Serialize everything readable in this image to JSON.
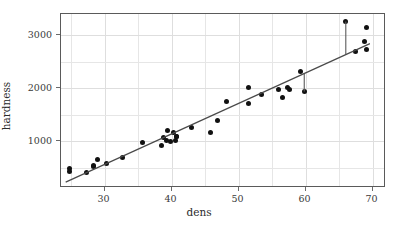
{
  "chart_data": {
    "type": "scatter",
    "title": "",
    "xlabel": "dens",
    "ylabel": "hardness",
    "xlim": [
      23.5,
      72.0
    ],
    "ylim": [
      120,
      3400
    ],
    "grid": true,
    "legend": null,
    "xticks": [
      30,
      40,
      50,
      60,
      70
    ],
    "xtick_labels": [
      "30",
      "40",
      "50",
      "60",
      "70"
    ],
    "yticks": [
      1000,
      2000,
      3000
    ],
    "ytick_labels": [
      "1000",
      "2000",
      "3000"
    ],
    "minor_xticks": [
      25,
      35,
      45,
      55,
      65
    ],
    "minor_yticks": [
      500,
      1500,
      2500
    ],
    "point_color": "#111111",
    "line_color": "#4a4a4a",
    "grid_color": "#e6e6e6",
    "frame_color": "#5a5a5a",
    "points": [
      {
        "x": 24.7,
        "y": 484
      },
      {
        "x": 24.8,
        "y": 427
      },
      {
        "x": 27.3,
        "y": 413
      },
      {
        "x": 28.4,
        "y": 517
      },
      {
        "x": 28.4,
        "y": 549
      },
      {
        "x": 29.0,
        "y": 648
      },
      {
        "x": 30.3,
        "y": 587
      },
      {
        "x": 32.7,
        "y": 704
      },
      {
        "x": 35.6,
        "y": 979
      },
      {
        "x": 38.5,
        "y": 914
      },
      {
        "x": 38.8,
        "y": 1070
      },
      {
        "x": 39.3,
        "y": 1020
      },
      {
        "x": 39.4,
        "y": 1210
      },
      {
        "x": 39.9,
        "y": 989
      },
      {
        "x": 40.3,
        "y": 1160
      },
      {
        "x": 40.6,
        "y": 1010
      },
      {
        "x": 40.7,
        "y": 1100
      },
      {
        "x": 40.7,
        "y": 1100
      },
      {
        "x": 42.9,
        "y": 1260
      },
      {
        "x": 45.8,
        "y": 1170
      },
      {
        "x": 46.9,
        "y": 1400
      },
      {
        "x": 48.2,
        "y": 1760
      },
      {
        "x": 51.5,
        "y": 1710
      },
      {
        "x": 51.5,
        "y": 2010
      },
      {
        "x": 53.4,
        "y": 1880
      },
      {
        "x": 56.0,
        "y": 1980
      },
      {
        "x": 56.5,
        "y": 1820
      },
      {
        "x": 57.3,
        "y": 2020
      },
      {
        "x": 57.6,
        "y": 1980
      },
      {
        "x": 59.2,
        "y": 2310
      },
      {
        "x": 59.8,
        "y": 1940
      },
      {
        "x": 66.0,
        "y": 3260
      },
      {
        "x": 67.4,
        "y": 2700
      },
      {
        "x": 68.8,
        "y": 2890
      },
      {
        "x": 69.1,
        "y": 2740
      },
      {
        "x": 69.1,
        "y": 3140
      }
    ],
    "regression_line": {
      "x_start": 24.2,
      "x_end": 69.6,
      "slope": 57.5,
      "intercept": -1160
    },
    "residual_segments": [
      {
        "x": 66.0,
        "y_point": 3260,
        "y_fit": 2635
      },
      {
        "x": 59.8,
        "y_point": 1940,
        "y_fit": 2278
      }
    ]
  }
}
